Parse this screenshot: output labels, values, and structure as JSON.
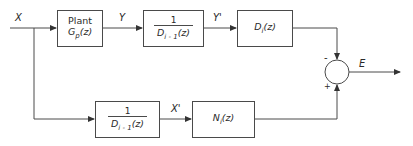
{
  "diagram": {
    "signals": {
      "input": "X",
      "plant_output": "Y",
      "filtered_output": "Y'",
      "filtered_input": "X'",
      "error": "E"
    },
    "blocks": {
      "plant": {
        "title": "Plant",
        "tf": "G",
        "tf_sub": "p",
        "tf_arg": "(z)"
      },
      "prefilter_top": {
        "numerator": "1",
        "den_main": "D",
        "den_sub": "i - 1",
        "den_arg": "(z)"
      },
      "denominator_model": {
        "main": "D",
        "sub": "i",
        "arg": "(z)"
      },
      "prefilter_bottom": {
        "numerator": "1",
        "den_main": "D",
        "den_sub": "i - 1",
        "den_arg": "(z)"
      },
      "numerator_model": {
        "main": "N",
        "sub": "i",
        "arg": "(z)"
      }
    },
    "summing_junction": {
      "top_sign": "-",
      "bottom_sign": "+"
    },
    "colors": {
      "line": "#4a4a4a",
      "text": "#2a2a2a",
      "background": "#ffffff"
    }
  }
}
